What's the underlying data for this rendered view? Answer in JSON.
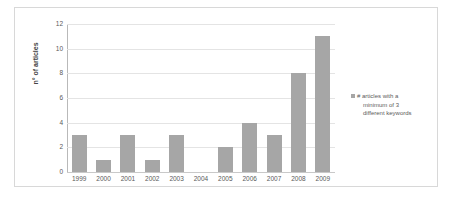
{
  "chart_data": {
    "type": "bar",
    "title": "",
    "xlabel": "",
    "ylabel": "n° of articles",
    "categories": [
      "1999",
      "2000",
      "2001",
      "2002",
      "2003",
      "2004",
      "2005",
      "2006",
      "2007",
      "2008",
      "2009"
    ],
    "values": [
      3,
      1,
      3,
      1,
      3,
      0,
      2,
      4,
      3,
      8,
      11
    ],
    "ylim": [
      0,
      12
    ],
    "yticks": [
      12,
      10,
      8,
      6,
      4,
      2,
      0
    ],
    "grid": true,
    "legend_position": "right",
    "series": [
      {
        "name": "# articles with a minimum of 3 different keywords",
        "values": [
          3,
          1,
          3,
          1,
          3,
          0,
          2,
          4,
          3,
          8,
          11
        ],
        "color": "#a6a6a6"
      }
    ],
    "legend_lines": [
      "# articles with a",
      "minimum of 3",
      "different keywords"
    ]
  },
  "colors": {
    "bar": "#a6a6a6",
    "gridline": "#e4e4e4",
    "axis": "#b9b9b9",
    "border": "#d8d8d8",
    "tick_text": "#595959",
    "legend_text": "#5a5a5a"
  }
}
